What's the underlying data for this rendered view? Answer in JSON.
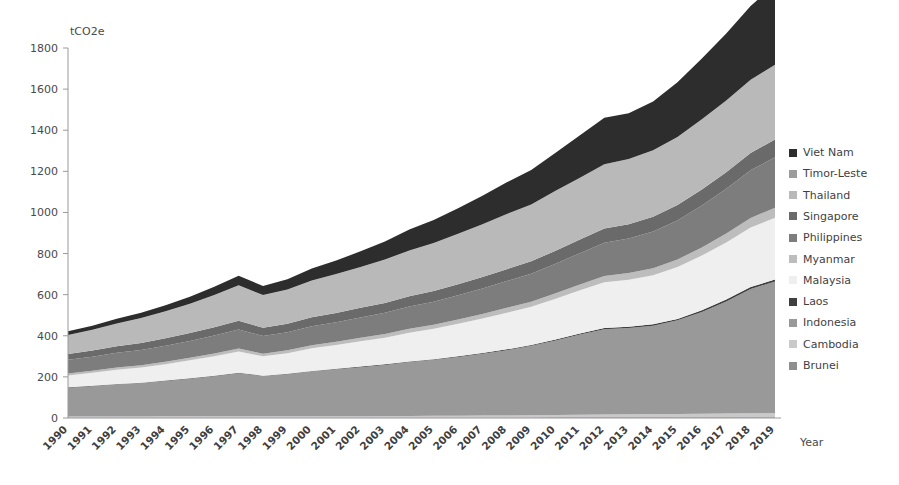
{
  "chart_data": {
    "type": "area",
    "stacked": true,
    "title": "",
    "subtitle": "",
    "xlabel": "Year",
    "ylabel": "tCO2e",
    "unit_label": "tCO2e",
    "grid": false,
    "legend_position": "right",
    "ylim": [
      0,
      1800
    ],
    "yticks": [
      0,
      200,
      400,
      600,
      800,
      1000,
      1200,
      1400,
      1600,
      1800
    ],
    "categories": [
      "1990",
      "1991",
      "1992",
      "1993",
      "1994",
      "1995",
      "1996",
      "1997",
      "1998",
      "1999",
      "2000",
      "2001",
      "2002",
      "2003",
      "2004",
      "2005",
      "2006",
      "2007",
      "2008",
      "2009",
      "2010",
      "2011",
      "2012",
      "2013",
      "2014",
      "2015",
      "2016",
      "2017",
      "2018",
      "2019"
    ],
    "x": [
      1990,
      1991,
      1992,
      1993,
      1994,
      1995,
      1996,
      1997,
      1998,
      1999,
      2000,
      2001,
      2002,
      2003,
      2004,
      2005,
      2006,
      2007,
      2008,
      2009,
      2010,
      2011,
      2012,
      2013,
      2014,
      2015,
      2016,
      2017,
      2018,
      2019
    ],
    "series": [
      {
        "name": "Brunei",
        "color": "#8f8f8f",
        "values": [
          3,
          3,
          3,
          3,
          3,
          3,
          3,
          3,
          3,
          3,
          3,
          3,
          3,
          3,
          3,
          3,
          3,
          3,
          3,
          3,
          4,
          4,
          4,
          4,
          4,
          4,
          4,
          4,
          4,
          4
        ]
      },
      {
        "name": "Cambodia",
        "color": "#c9c9c9",
        "values": [
          4,
          4,
          4,
          4,
          5,
          5,
          5,
          5,
          5,
          5,
          6,
          6,
          6,
          7,
          7,
          8,
          8,
          9,
          9,
          10,
          11,
          12,
          13,
          14,
          15,
          16,
          17,
          18,
          19,
          20
        ]
      },
      {
        "name": "Indonesia",
        "color": "#999999",
        "values": [
          140,
          148,
          157,
          163,
          172,
          183,
          195,
          210,
          196,
          205,
          218,
          228,
          238,
          248,
          262,
          272,
          286,
          300,
          318,
          338,
          362,
          390,
          415,
          420,
          430,
          455,
          495,
          545,
          605,
          640
        ]
      },
      {
        "name": "Laos",
        "color": "#3f3f3f",
        "values": [
          2,
          2,
          2,
          2,
          2,
          2,
          2,
          2,
          2,
          2,
          2,
          2,
          3,
          3,
          3,
          3,
          3,
          4,
          4,
          4,
          5,
          5,
          6,
          6,
          7,
          7,
          8,
          9,
          9,
          10
        ]
      },
      {
        "name": "Malaysia",
        "color": "#efefef",
        "values": [
          58,
          63,
          69,
          74,
          80,
          88,
          96,
          104,
          94,
          100,
          110,
          116,
          123,
          130,
          140,
          148,
          158,
          168,
          178,
          186,
          198,
          210,
          222,
          228,
          238,
          252,
          266,
          278,
          290,
          300
        ]
      },
      {
        "name": "Myanmar",
        "color": "#bdbdbd",
        "values": [
          10,
          10,
          11,
          11,
          12,
          12,
          13,
          14,
          13,
          14,
          15,
          16,
          17,
          18,
          19,
          20,
          21,
          22,
          24,
          25,
          27,
          29,
          31,
          33,
          35,
          37,
          40,
          43,
          46,
          49
        ]
      },
      {
        "name": "Philippines",
        "color": "#7d7d7d",
        "values": [
          66,
          68,
          71,
          74,
          78,
          82,
          87,
          92,
          86,
          88,
          92,
          95,
          99,
          103,
          108,
          112,
          118,
          124,
          130,
          136,
          144,
          152,
          162,
          168,
          178,
          190,
          204,
          218,
          232,
          245
        ]
      },
      {
        "name": "Singapore",
        "color": "#6a6a6a",
        "values": [
          28,
          30,
          32,
          34,
          36,
          38,
          40,
          43,
          40,
          42,
          44,
          45,
          47,
          48,
          50,
          52,
          54,
          56,
          58,
          60,
          63,
          66,
          69,
          70,
          72,
          75,
          78,
          81,
          84,
          87
        ]
      },
      {
        "name": "Thailand",
        "color": "#b9b9b9",
        "values": [
          92,
          100,
          110,
          120,
          130,
          142,
          156,
          172,
          158,
          165,
          178,
          188,
          198,
          210,
          222,
          232,
          244,
          256,
          268,
          276,
          290,
          300,
          312,
          316,
          322,
          330,
          340,
          348,
          356,
          362
        ]
      },
      {
        "name": "Timor-Leste",
        "color": "#9c9c9c",
        "values": [
          1,
          1,
          1,
          1,
          1,
          1,
          1,
          1,
          1,
          1,
          1,
          1,
          1,
          1,
          1,
          1,
          1,
          1,
          1,
          1,
          1,
          1,
          1,
          1,
          1,
          1,
          1,
          1,
          1,
          1
        ]
      },
      {
        "name": "Viet Nam",
        "color": "#2d2d2d",
        "values": [
          18,
          20,
          23,
          26,
          30,
          34,
          40,
          46,
          44,
          50,
          58,
          66,
          76,
          88,
          102,
          112,
          124,
          138,
          154,
          168,
          186,
          206,
          226,
          222,
          238,
          266,
          296,
          326,
          358,
          392
        ]
      }
    ],
    "stack_order_bottom_to_top": [
      "Brunei",
      "Cambodia",
      "Indonesia",
      "Laos",
      "Malaysia",
      "Myanmar",
      "Philippines",
      "Singapore",
      "Thailand",
      "Timor-Leste",
      "Viet Nam"
    ],
    "totals": [
      422,
      449,
      483,
      512,
      549,
      590,
      638,
      692,
      642,
      672,
      727,
      767,
      811,
      860,
      917,
      963,
      1016,
      1078,
      1147,
      1204,
      1291,
      1375,
      1461,
      1482,
      1540,
      1633,
      1749,
      1871,
      2004,
      2110
    ],
    "annotations": []
  },
  "legend": {
    "position": "right",
    "items": [
      {
        "label": "Viet Nam",
        "color": "#2d2d2d"
      },
      {
        "label": "Timor-Leste",
        "color": "#9c9c9c"
      },
      {
        "label": "Thailand",
        "color": "#b9b9b9"
      },
      {
        "label": "Singapore",
        "color": "#6a6a6a"
      },
      {
        "label": "Philippines",
        "color": "#7d7d7d"
      },
      {
        "label": "Myanmar",
        "color": "#bdbdbd"
      },
      {
        "label": "Malaysia",
        "color": "#efefef"
      },
      {
        "label": "Laos",
        "color": "#3f3f3f"
      },
      {
        "label": "Indonesia",
        "color": "#999999"
      },
      {
        "label": "Cambodia",
        "color": "#c9c9c9"
      },
      {
        "label": "Brunei",
        "color": "#8f8f8f"
      }
    ]
  },
  "axes": {
    "y_unit": "tCO2e",
    "x_title": "Year",
    "y_tick_labels": [
      "0",
      "200",
      "400",
      "600",
      "800",
      "1000",
      "1200",
      "1400",
      "1600",
      "1800"
    ]
  }
}
